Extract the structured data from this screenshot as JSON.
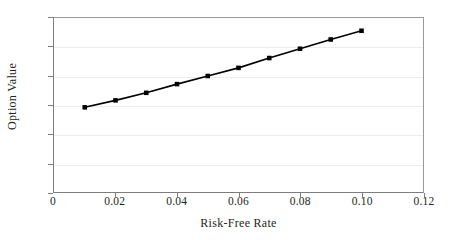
{
  "chart_data": {
    "type": "line",
    "title": "",
    "xlabel": "Risk-Free Rate",
    "ylabel": "Option Value",
    "xlim": [
      0,
      0.12
    ],
    "ylim": [
      0,
      30
    ],
    "grid": "horizontal",
    "legend": "none",
    "marker": "square",
    "line_color": "#000000",
    "marker_color": "#000000",
    "grid_color": "#ededed",
    "axis_color": "#7d7d7d",
    "xticks": [
      0,
      0.02,
      0.04,
      0.06,
      0.08,
      0.1,
      0.12
    ],
    "xtick_labels": [
      "0",
      "0.02",
      "0.04",
      "0.06",
      "0.08",
      "0.10",
      "0.12"
    ],
    "yticks": [
      0,
      5,
      10,
      15,
      20,
      25,
      30
    ],
    "ytick_labels": [
      "0",
      "5",
      "10",
      "15",
      "20",
      "25",
      "30"
    ],
    "x": [
      0.01,
      0.02,
      0.03,
      0.04,
      0.05,
      0.06,
      0.07,
      0.08,
      0.09,
      0.1
    ],
    "values": [
      14.6,
      15.8,
      17.1,
      18.6,
      20.0,
      21.4,
      23.1,
      24.7,
      26.3,
      27.8
    ],
    "series": [
      {
        "name": "Option Value",
        "x": [
          0.01,
          0.02,
          0.03,
          0.04,
          0.05,
          0.06,
          0.07,
          0.08,
          0.09,
          0.1
        ],
        "values": [
          14.6,
          15.8,
          17.1,
          18.6,
          20.0,
          21.4,
          23.1,
          24.7,
          26.3,
          27.8
        ]
      }
    ]
  }
}
